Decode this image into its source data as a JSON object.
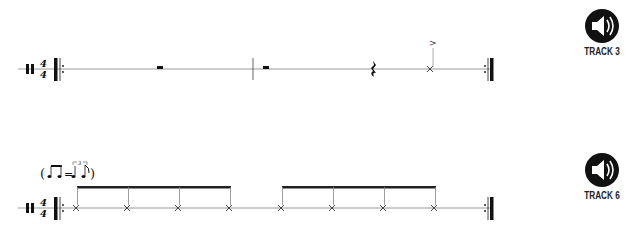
{
  "systems": [
    {
      "id": "track3-excerpt",
      "time_signature": {
        "top": "4",
        "bottom": "4"
      },
      "percussion_clef": true,
      "repeat_start": true,
      "repeat_end": true,
      "measures": [
        {
          "content": "half rest"
        },
        {
          "content": "half rest, quarter rest, accented x-note (cymbal)"
        }
      ],
      "accent_symbol": ">",
      "track": {
        "label": "TRACK 3",
        "icon": "speaker-icon"
      }
    },
    {
      "id": "track6-excerpt",
      "tempo_marking": {
        "text_open": "(",
        "equals": "=",
        "text_close": ")",
        "triplet_number": "3",
        "meaning": "swing eighths: two eighths = triplet quarter + eighth"
      },
      "time_signature": {
        "top": "4",
        "bottom": "4"
      },
      "percussion_clef": true,
      "repeat_start": true,
      "repeat_end": true,
      "measures": [
        {
          "content": "4 beamed x-note eighths"
        },
        {
          "content": "4 beamed x-note eighths"
        }
      ],
      "track": {
        "label": "TRACK 6",
        "icon": "speaker-icon"
      }
    }
  ],
  "colors": {
    "ink": "#111111",
    "staff_line": "#999999",
    "stem": "#888888"
  }
}
